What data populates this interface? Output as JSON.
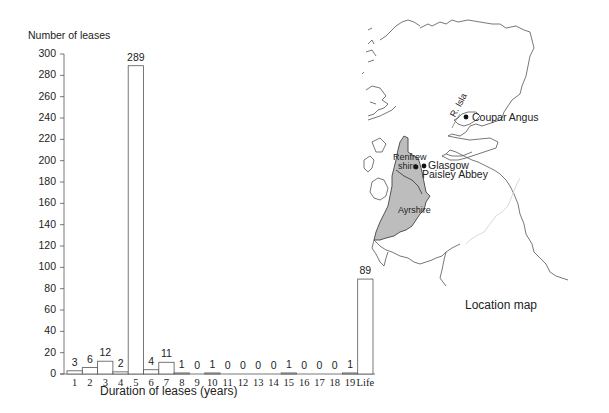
{
  "chart_data": {
    "type": "bar",
    "title": "",
    "ylabel": "Number of leases",
    "xlabel": "Duration of leases (years)",
    "ylim": [
      0,
      300
    ],
    "yticks": [
      0,
      20,
      40,
      60,
      80,
      100,
      120,
      140,
      160,
      180,
      200,
      220,
      240,
      260,
      280,
      300
    ],
    "categories": [
      "1",
      "2",
      "3",
      "4",
      "5",
      "6",
      "7",
      "8",
      "9",
      "10",
      "11",
      "12",
      "13",
      "14",
      "15",
      "16",
      "17",
      "18",
      "19",
      "Life"
    ],
    "values": [
      3,
      6,
      12,
      2,
      289,
      4,
      11,
      1,
      0,
      1,
      0,
      0,
      0,
      0,
      1,
      0,
      0,
      0,
      1,
      89
    ],
    "grid": false,
    "legend": null
  },
  "map": {
    "caption": "Location map",
    "places": {
      "coupar_angus": "Coupar Angus",
      "glasgow": "Glasgow",
      "paisley_abbey": "Paisley Abbey",
      "renfrew_1": "Renfrew",
      "renfrew_2": "shire",
      "ayrshire": "Ayrshire",
      "river": "R. Isla"
    },
    "shade_color": "#bdbdbd"
  }
}
